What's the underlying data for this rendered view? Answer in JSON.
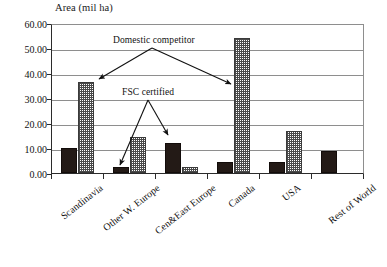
{
  "chart_data": {
    "type": "bar",
    "title": "Area (mil ha)",
    "xlabel": "",
    "ylabel": "",
    "ylim": [
      0,
      60
    ],
    "ytick_step": 10,
    "grid": true,
    "legend": "none",
    "categories": [
      "Scandinavia",
      "Other W. Europe",
      "Cen&East Europe",
      "Canada",
      "USA",
      "Rest of World"
    ],
    "series": [
      {
        "name": "FSC certified",
        "style": "solid-black",
        "values": [
          10.0,
          2.5,
          12.0,
          4.5,
          4.5,
          9.0
        ]
      },
      {
        "name": "Domestic competitor",
        "style": "hatched-gray",
        "values": [
          36.5,
          14.5,
          2.5,
          54.0,
          17.0,
          0.0
        ]
      }
    ],
    "ytick_labels": [
      "0.00",
      "10.00",
      "20.00",
      "30.00",
      "40.00",
      "50.00",
      "60.00"
    ],
    "annotations": [
      {
        "text": "Domestic competitor",
        "points_to": [
          "Scandinavia domestic bar",
          "Canada domestic bar"
        ]
      },
      {
        "text": "FSC certified",
        "points_to": [
          "Other W. Europe certified bar",
          "Cen&East Europe certified bar"
        ]
      }
    ]
  },
  "colors": {
    "certified_bar": "#231a16",
    "domestic_bar_hatch": "#4a4a4a",
    "gridline": "#8e8e8e",
    "axis": "#2b2b2b",
    "text": "#111111",
    "background": "#ffffff"
  }
}
